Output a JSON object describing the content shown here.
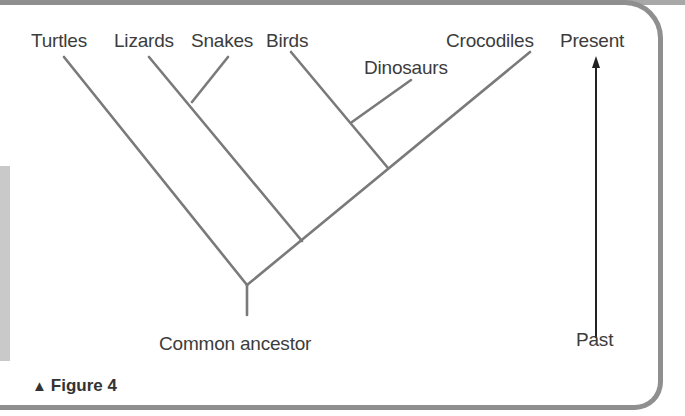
{
  "figure": {
    "caption_icon": "triangle-up-icon",
    "caption": "Figure 4"
  },
  "taxa": {
    "turtles": "Turtles",
    "lizards": "Lizards",
    "snakes": "Snakes",
    "birds": "Birds",
    "dinosaurs": "Dinosaurs",
    "crocodiles": "Crocodiles"
  },
  "root_label": "Common ancestor",
  "time_axis": {
    "top_label": "Present",
    "bottom_label": "Past",
    "arrow_direction": "up"
  },
  "colors": {
    "branch": "#7a7a7a",
    "arrow": "#222222",
    "border": "#8f8f8f",
    "text": "#3c3c3c"
  }
}
